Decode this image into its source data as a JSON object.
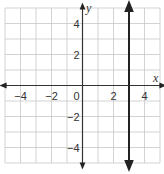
{
  "chart_data": {
    "type": "line",
    "title": "",
    "xlabel": "x",
    "ylabel": "y",
    "xlim": [
      -5,
      5
    ],
    "ylim": [
      -5,
      5
    ],
    "grid": true,
    "grid_step": 1,
    "x_ticks": [
      -4,
      -2,
      0,
      2,
      4
    ],
    "x_tick_labels": [
      "−4",
      "−2",
      "0",
      "2",
      "4"
    ],
    "y_ticks": [
      4,
      2,
      -2,
      -4
    ],
    "y_tick_labels": [
      "4",
      "2",
      "−2",
      "−4"
    ],
    "series": [
      {
        "name": "x = 3",
        "kind": "vertical-line",
        "x": 3,
        "points": [
          [
            3,
            -5
          ],
          [
            3,
            5
          ]
        ],
        "arrows": "both",
        "color": "#222222"
      }
    ],
    "colors": {
      "grid": "#c8c8c8",
      "axes": "#333333",
      "line": "#222222"
    }
  }
}
